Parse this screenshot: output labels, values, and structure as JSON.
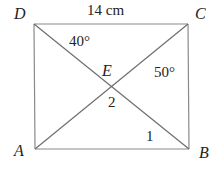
{
  "diagram": {
    "title": "",
    "line_color": "#8a8a8a",
    "text_color": "#222222",
    "rectangle": {
      "vertices": [
        {
          "name": "A",
          "x": 35,
          "y": 149
        },
        {
          "name": "B",
          "x": 189,
          "y": 149
        },
        {
          "name": "C",
          "x": 188,
          "y": 24
        },
        {
          "name": "D",
          "x": 34,
          "y": 24
        }
      ]
    },
    "diagonals": [
      {
        "from": "D",
        "to": "B"
      },
      {
        "from": "A",
        "to": "C"
      }
    ],
    "intersection": {
      "name": "E",
      "x": 112,
      "y": 87
    },
    "labels": {
      "vertex_A": "A",
      "vertex_B": "B",
      "vertex_C": "C",
      "vertex_D": "D",
      "intersection_E": "E",
      "side_DC_length": "14 cm",
      "angle_D": "40°",
      "angle_C": "50°",
      "angle_2": "2",
      "angle_1": "1"
    }
  }
}
